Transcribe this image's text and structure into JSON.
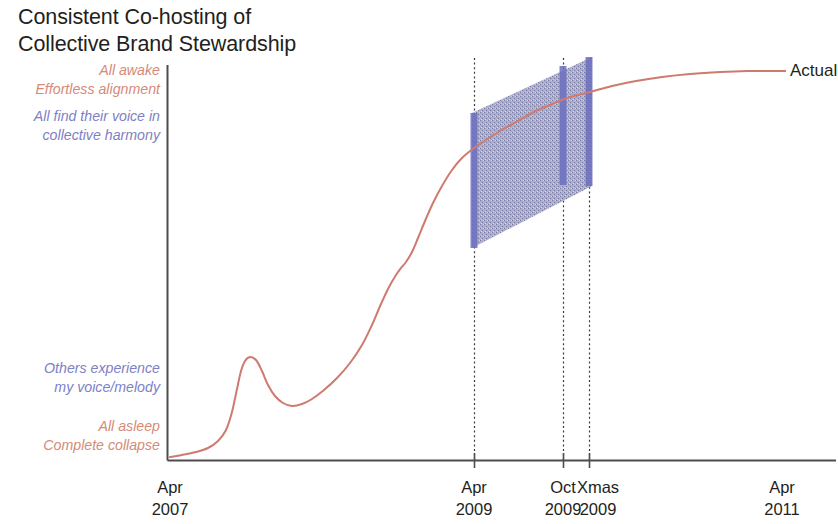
{
  "title": "Consistent Co-hosting of\nCollective Brand Stewardship",
  "colors": {
    "curve": "#cf7a6e",
    "axis": "#4d4d4d",
    "band_fill": "#8f92b4",
    "bar": "#6b6fc0",
    "annotation_salmon": "#d58a78",
    "annotation_blue": "#7d80c4",
    "text": "#231f20",
    "background": "#ffffff"
  },
  "annotations": {
    "top_salmon": "All awake\nEffortless alignment",
    "top_blue": "All find their voice in\ncollective harmony",
    "bottom_blue": "Others experience\nmy voice/melody",
    "bottom_salmon": "All asleep\nComplete collapse"
  },
  "series_label": "Actual",
  "chart_data": {
    "type": "line",
    "title": "Consistent Co-hosting of Collective Brand Stewardship",
    "xlabel": "",
    "ylabel": "",
    "grid": false,
    "legend_position": "right-end-of-line",
    "x_axis": {
      "ticks": [
        {
          "label": "Apr\n2007",
          "label_line1": "Apr",
          "label_line2": "2007",
          "x_px": 170,
          "tick_drawn": false
        },
        {
          "label": "Apr\n2009",
          "label_line1": "Apr",
          "label_line2": "2009",
          "x_px": 474,
          "tick_drawn": true
        },
        {
          "label": "Oct\n2009",
          "label_line1": "Oct",
          "label_line2": "2009",
          "x_px": 563,
          "tick_drawn": true
        },
        {
          "label": "Xmas\n2009",
          "label_line1": "Xmas",
          "label_line2": "2009",
          "x_px": 589,
          "tick_drawn": true
        },
        {
          "label": "Apr\n2011",
          "label_line1": "Apr",
          "label_line2": "2011",
          "x_px": 782,
          "tick_drawn": false
        }
      ]
    },
    "y_axis": {
      "labeled_levels": [
        {
          "label": "All awake / Effortless alignment",
          "color": "#d58a78",
          "y_px": 70
        },
        {
          "label": "All find their voice in collective harmony",
          "color": "#7d80c4",
          "y_px": 116
        },
        {
          "label": "Others experience my voice/melody",
          "color": "#7d80c4",
          "y_px": 368
        },
        {
          "label": "All asleep / Complete collapse",
          "color": "#d58a78",
          "y_px": 426
        }
      ],
      "range_px": [
        460,
        65
      ]
    },
    "series": [
      {
        "name": "Actual",
        "color": "#cf7a6e",
        "points_px": [
          [
            170,
            457
          ],
          [
            182,
            455
          ],
          [
            196,
            452
          ],
          [
            208,
            448
          ],
          [
            218,
            441
          ],
          [
            226,
            430
          ],
          [
            232,
            412
          ],
          [
            237,
            389
          ],
          [
            241,
            371
          ],
          [
            245,
            361
          ],
          [
            250,
            357
          ],
          [
            256,
            360
          ],
          [
            262,
            371
          ],
          [
            268,
            385
          ],
          [
            275,
            396
          ],
          [
            283,
            403
          ],
          [
            292,
            406
          ],
          [
            302,
            404
          ],
          [
            312,
            399
          ],
          [
            324,
            390
          ],
          [
            337,
            378
          ],
          [
            350,
            363
          ],
          [
            362,
            345
          ],
          [
            372,
            325
          ],
          [
            381,
            304
          ],
          [
            389,
            287
          ],
          [
            396,
            275
          ],
          [
            401,
            268
          ],
          [
            406,
            262
          ],
          [
            412,
            252
          ],
          [
            418,
            238
          ],
          [
            425,
            221
          ],
          [
            433,
            203
          ],
          [
            442,
            186
          ],
          [
            452,
            170
          ],
          [
            462,
            158
          ],
          [
            474,
            148
          ],
          [
            486,
            140
          ],
          [
            500,
            131
          ],
          [
            516,
            122
          ],
          [
            534,
            112
          ],
          [
            552,
            104
          ],
          [
            570,
            97
          ],
          [
            590,
            92
          ],
          [
            612,
            86
          ],
          [
            636,
            81
          ],
          [
            662,
            77
          ],
          [
            690,
            74
          ],
          [
            720,
            72
          ],
          [
            748,
            71
          ],
          [
            772,
            71
          ]
        ],
        "label_anchor_px": [
          786,
          71
        ]
      }
    ],
    "band": {
      "name": "forecast-uncertainty-band",
      "fill": "#8f92b4",
      "polygon_px": [
        [
          472,
          113
        ],
        [
          592,
          57
        ],
        [
          592,
          186
        ],
        [
          472,
          248
        ]
      ]
    },
    "markers": [
      {
        "name": "apr-2009-marker",
        "x_px": 474,
        "top_px": 113,
        "bottom_px": 248,
        "color": "#6b6fc0"
      },
      {
        "name": "oct-2009-marker",
        "x_px": 563,
        "top_px": 66,
        "bottom_px": 185,
        "color": "#6b6fc0"
      },
      {
        "name": "xmas-2009-marker",
        "x_px": 589,
        "top_px": 57,
        "bottom_px": 186,
        "color": "#6b6fc0"
      }
    ],
    "dotted_verticals_px": [
      474,
      563,
      589
    ]
  }
}
